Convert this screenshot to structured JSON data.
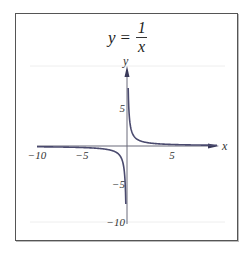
{
  "chart_data": {
    "type": "line",
    "title_parts": {
      "lhs": "y",
      "eq": "=",
      "numerator": "1",
      "denominator": "x"
    },
    "xlabel": "x",
    "ylabel": "y",
    "xlim": [
      -10,
      10
    ],
    "ylim": [
      -10,
      10
    ],
    "x_ticks": [
      {
        "value": -10,
        "label": "−10"
      },
      {
        "value": -5,
        "label": "−5"
      },
      {
        "value": 5,
        "label": "5"
      }
    ],
    "y_ticks": [
      {
        "value": 5,
        "label": "5"
      },
      {
        "value": -5,
        "label": "−5"
      },
      {
        "value": -10,
        "label": "−10"
      }
    ],
    "grid": true,
    "legend": null,
    "series": [
      {
        "name": "y = 1/x (x > 0)",
        "function": "1/x",
        "x": [
          0.1,
          0.15,
          0.2,
          0.3,
          0.5,
          0.75,
          1,
          1.5,
          2,
          3,
          4,
          5,
          6,
          7,
          8,
          9,
          10
        ],
        "values": [
          10,
          6.67,
          5,
          3.33,
          2,
          1.33,
          1,
          0.67,
          0.5,
          0.33,
          0.25,
          0.2,
          0.17,
          0.14,
          0.125,
          0.11,
          0.1
        ]
      },
      {
        "name": "y = 1/x (x < 0)",
        "function": "1/x",
        "x": [
          -10,
          -9,
          -8,
          -7,
          -6,
          -5,
          -4,
          -3,
          -2,
          -1.5,
          -1,
          -0.75,
          -0.5,
          -0.3,
          -0.2,
          -0.15,
          -0.1
        ],
        "values": [
          -0.1,
          -0.11,
          -0.125,
          -0.14,
          -0.17,
          -0.2,
          -0.25,
          -0.33,
          -0.5,
          -0.67,
          -1,
          -1.33,
          -2,
          -3.33,
          -5,
          -6.67,
          -10
        ]
      }
    ],
    "colors": {
      "curve": "#4a4a6e",
      "axis": "#6a6a7a",
      "grid": "#eeeeee",
      "frame": "#555555"
    }
  }
}
